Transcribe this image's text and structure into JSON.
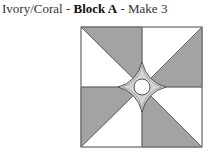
{
  "title": {
    "prefix": "Ivory/Coral - ",
    "block": "Block A",
    "suffix": " - Make 3"
  },
  "colors": {
    "dark": "#a3a3a3",
    "light": "#ffffff",
    "center": "#d4d4d4",
    "stroke": "#555555"
  },
  "block": {
    "name": "quilt-block-diagram",
    "quadrants": [
      "pinwheel-triangles"
    ],
    "center_shape": "four-point star with circle"
  }
}
